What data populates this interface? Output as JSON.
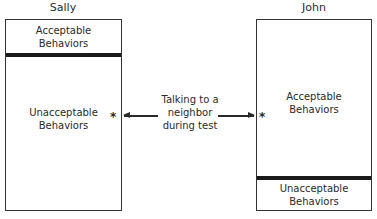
{
  "left_person": {
    "name": "Sally",
    "top_section": "Acceptable Behaviors",
    "bottom_section": "Unacceptable Behaviors"
  },
  "right_person": {
    "name": "John",
    "top_section": "Acceptable Behaviors",
    "bottom_section": "Unacceptable Behaviors"
  },
  "behavior": {
    "label_line1": "Talking to a",
    "label_line2": "neighbor",
    "label_line3": "during test",
    "marker": "*"
  }
}
